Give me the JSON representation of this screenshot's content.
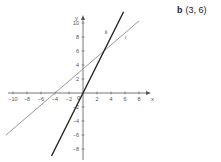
{
  "answer": {
    "label": "b",
    "value": "(3, 6)"
  },
  "chart_data": {
    "type": "line",
    "title": "",
    "xlabel": "x",
    "ylabel": "y",
    "xlim": [
      -11,
      9
    ],
    "ylim": [
      -9,
      11
    ],
    "x_ticks": [
      -10,
      -8,
      -6,
      -4,
      -2,
      2,
      4,
      6,
      8
    ],
    "y_ticks": [
      -8,
      -6,
      -4,
      -2,
      2,
      4,
      6,
      8,
      10
    ],
    "origin_label": "0",
    "grid": false,
    "series": [
      {
        "name": "i",
        "equation": "y = (6/7)(x + 4)",
        "points": [
          [
            -11,
            -6
          ],
          [
            8,
            10.3
          ]
        ],
        "color": "#999999"
      },
      {
        "name": "ii",
        "equation": "y = 2x",
        "points": [
          [
            -4.5,
            -9
          ],
          [
            5.8,
            11.6
          ]
        ],
        "color": "#222222"
      }
    ],
    "intersection": [
      3,
      6
    ]
  }
}
